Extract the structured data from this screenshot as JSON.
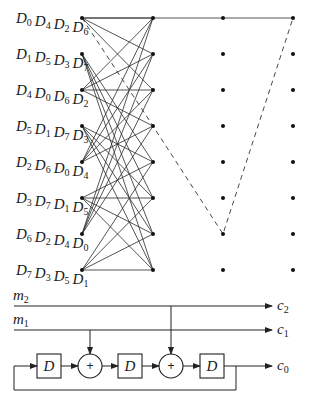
{
  "trellis": {
    "columns_x": [
      82,
      153,
      223,
      293
    ],
    "rows_y": [
      18,
      54,
      90,
      126,
      162,
      198,
      234,
      270
    ],
    "state_labels": [
      [
        "0",
        "4",
        "2",
        "6"
      ],
      [
        "1",
        "5",
        "3",
        "7"
      ],
      [
        "4",
        "0",
        "6",
        "2"
      ],
      [
        "5",
        "1",
        "7",
        "3"
      ],
      [
        "2",
        "6",
        "0",
        "4"
      ],
      [
        "3",
        "7",
        "1",
        "5"
      ],
      [
        "6",
        "2",
        "4",
        "0"
      ],
      [
        "7",
        "3",
        "5",
        "1"
      ]
    ],
    "label_prefix": "D",
    "transitions": {
      "even_states_to": [
        0,
        1,
        2,
        3
      ],
      "odd_states_to": [
        4,
        5,
        6,
        7
      ]
    },
    "solid_path": [
      [
        0,
        0
      ],
      [
        1,
        0
      ],
      [
        2,
        0
      ],
      [
        3,
        0
      ]
    ],
    "dashed_path": [
      [
        0,
        0
      ],
      [
        1,
        3
      ],
      [
        2,
        6
      ],
      [
        3,
        0
      ]
    ]
  },
  "encoder": {
    "inputs": [
      {
        "name": "m",
        "sub": "2",
        "y": 306
      },
      {
        "name": "m",
        "sub": "1",
        "y": 330
      }
    ],
    "outputs": [
      {
        "name": "c",
        "sub": "2",
        "y": 306
      },
      {
        "name": "c",
        "sub": "1",
        "y": 330
      },
      {
        "name": "c",
        "sub": "0",
        "y": 366
      }
    ],
    "delay_label": "D",
    "adder_symbol": "+",
    "delays": [
      {
        "x": 37
      },
      {
        "x": 118
      },
      {
        "x": 200
      }
    ],
    "adders": [
      {
        "cx": 90,
        "tap_from": "m1"
      },
      {
        "cx": 171,
        "tap_from": "m2"
      }
    ]
  }
}
